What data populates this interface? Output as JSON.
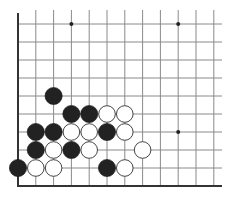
{
  "diagram": {
    "type": "go-board-fragment",
    "visible_columns": 12,
    "visible_rows": 10,
    "edges": [
      "left",
      "bottom"
    ],
    "colors": {
      "background": "#ffffff",
      "grid_line": "#8a8a8a",
      "edge_line": "#333333",
      "black_stone": "#222222",
      "white_stone": "#ffffff",
      "white_stone_outline": "#444444",
      "star_point": "#222222"
    },
    "star_points": [
      {
        "col": 3,
        "row": 0
      },
      {
        "col": 9,
        "row": 0
      },
      {
        "col": 9,
        "row": 6
      }
    ],
    "stones": [
      {
        "color": "black",
        "col": 2,
        "row": 4
      },
      {
        "color": "black",
        "col": 3,
        "row": 5
      },
      {
        "color": "black",
        "col": 4,
        "row": 5
      },
      {
        "color": "white",
        "col": 5,
        "row": 5
      },
      {
        "color": "white",
        "col": 6,
        "row": 5
      },
      {
        "color": "black",
        "col": 1,
        "row": 6
      },
      {
        "color": "black",
        "col": 2,
        "row": 6
      },
      {
        "color": "white",
        "col": 3,
        "row": 6
      },
      {
        "color": "white",
        "col": 4,
        "row": 6
      },
      {
        "color": "black",
        "col": 5,
        "row": 6
      },
      {
        "color": "white",
        "col": 6,
        "row": 6
      },
      {
        "color": "black",
        "col": 1,
        "row": 7
      },
      {
        "color": "white",
        "col": 2,
        "row": 7
      },
      {
        "color": "black",
        "col": 3,
        "row": 7
      },
      {
        "color": "white",
        "col": 4,
        "row": 7
      },
      {
        "color": "white",
        "col": 7,
        "row": 7
      },
      {
        "color": "black",
        "col": 0,
        "row": 8
      },
      {
        "color": "white",
        "col": 1,
        "row": 8
      },
      {
        "color": "white",
        "col": 2,
        "row": 8
      },
      {
        "color": "black",
        "col": 5,
        "row": 8
      },
      {
        "color": "white",
        "col": 6,
        "row": 8
      }
    ]
  }
}
